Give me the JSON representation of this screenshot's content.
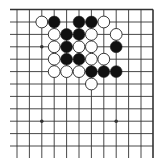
{
  "board": {
    "type": "go-diagram-corner",
    "colors": {
      "background": "#ffffff",
      "line": "#333333",
      "black_stone": "#111111",
      "white_stone": "#ffffff",
      "stone_outline": "#222222"
    },
    "columns_x": [
      17,
      29.4,
      41.8,
      54.2,
      66.6,
      79,
      91.4,
      103.8,
      116.2,
      128.6,
      141,
      153
    ],
    "rows_y": [
      9.5,
      22,
      34.4,
      46.8,
      59.2,
      71.6,
      84,
      96.4,
      108.8,
      121.2,
      133.6,
      146
    ],
    "open_left_extent": 10,
    "open_bottom_extent": 158,
    "edges": [
      "top",
      "right"
    ],
    "star_points": [
      {
        "col": 2,
        "row": 3
      },
      {
        "col": 2,
        "row": 9
      },
      {
        "col": 8,
        "row": 9
      }
    ],
    "stones": [
      {
        "color": "white",
        "col": 2,
        "row": 1
      },
      {
        "color": "black",
        "col": 3,
        "row": 1
      },
      {
        "color": "black",
        "col": 5,
        "row": 1
      },
      {
        "color": "black",
        "col": 6,
        "row": 1
      },
      {
        "color": "white",
        "col": 7,
        "row": 1
      },
      {
        "color": "white",
        "col": 3,
        "row": 2
      },
      {
        "color": "black",
        "col": 4,
        "row": 2
      },
      {
        "color": "black",
        "col": 5,
        "row": 2
      },
      {
        "color": "white",
        "col": 6,
        "row": 2
      },
      {
        "color": "white",
        "col": 8,
        "row": 2
      },
      {
        "color": "white",
        "col": 3,
        "row": 3
      },
      {
        "color": "black",
        "col": 4,
        "row": 3
      },
      {
        "color": "white",
        "col": 5,
        "row": 3
      },
      {
        "color": "white",
        "col": 6,
        "row": 3
      },
      {
        "color": "black",
        "col": 8,
        "row": 3
      },
      {
        "color": "white",
        "col": 3,
        "row": 4
      },
      {
        "color": "black",
        "col": 4,
        "row": 4
      },
      {
        "color": "black",
        "col": 5,
        "row": 4
      },
      {
        "color": "white",
        "col": 6,
        "row": 4
      },
      {
        "color": "white",
        "col": 7,
        "row": 4
      },
      {
        "color": "white",
        "col": 3,
        "row": 5
      },
      {
        "color": "white",
        "col": 4,
        "row": 5
      },
      {
        "color": "white",
        "col": 5,
        "row": 5
      },
      {
        "color": "black",
        "col": 6,
        "row": 5
      },
      {
        "color": "black",
        "col": 7,
        "row": 5
      },
      {
        "color": "black",
        "col": 8,
        "row": 5
      },
      {
        "color": "white",
        "col": 6,
        "row": 6
      }
    ]
  }
}
